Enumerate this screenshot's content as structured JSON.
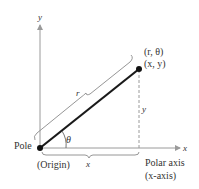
{
  "diagram": {
    "axis_labels": {
      "x": "x",
      "y": "y"
    },
    "point_labels": {
      "polar": "(r, θ)",
      "rect": "(x, y)"
    },
    "segment_label": "r",
    "vertical_label": "y",
    "horizontal_label": "x",
    "angle_label": "θ",
    "pole_label": "Pole",
    "origin_label": "(Origin)",
    "polar_axis_label": "Polar axis",
    "polar_axis_sub": "(x-axis)",
    "colors": {
      "axis": "#9a9a9a",
      "segment": "#1a1a1a",
      "brace": "#8a8a8a",
      "text": "#333333"
    }
  }
}
